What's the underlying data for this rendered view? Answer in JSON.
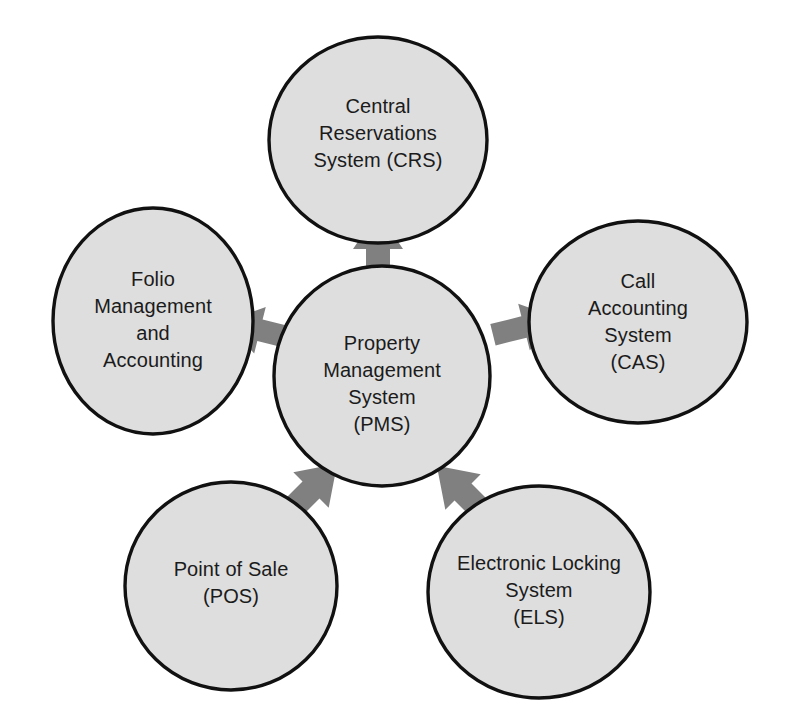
{
  "diagram": {
    "type": "hub-and-spoke",
    "background_color": "#ffffff",
    "node_fill_color": "#dedede",
    "node_stroke_color": "#111111",
    "arrow_color": "#808080",
    "text_color": "#1b1b1b",
    "nodes": [
      {
        "id": "crs",
        "name": "central-reservations-system",
        "label": "Central\nReservations\nSystem (CRS)",
        "abbreviation": "CRS",
        "role": "spoke",
        "position": "top"
      },
      {
        "id": "folio",
        "name": "folio-management-and-accounting",
        "label": "Folio\nManagement\nand\nAccounting",
        "abbreviation": "",
        "role": "spoke",
        "position": "left"
      },
      {
        "id": "cas",
        "name": "call-accounting-system",
        "label": "Call\nAccounting\nSystem\n(CAS)",
        "abbreviation": "CAS",
        "role": "spoke",
        "position": "right"
      },
      {
        "id": "pms",
        "name": "property-management-system",
        "label": "Property\nManagement\nSystem\n(PMS)",
        "abbreviation": "PMS",
        "role": "hub",
        "position": "center"
      },
      {
        "id": "pos",
        "name": "point-of-sale",
        "label": "Point of Sale\n(POS)",
        "abbreviation": "POS",
        "role": "spoke",
        "position": "bottom-left"
      },
      {
        "id": "els",
        "name": "electronic-locking-system",
        "label": "Electronic Locking\nSystem\n(ELS)",
        "abbreviation": "ELS",
        "role": "spoke",
        "position": "bottom-right"
      }
    ],
    "connections": [
      {
        "from": "pms",
        "to": "crs",
        "direction": "up"
      },
      {
        "from": "pms",
        "to": "folio",
        "direction": "left"
      },
      {
        "from": "pms",
        "to": "cas",
        "direction": "right"
      },
      {
        "from": "pms",
        "to": "pos",
        "direction": "down-left"
      },
      {
        "from": "pms",
        "to": "els",
        "direction": "down-right"
      }
    ]
  }
}
